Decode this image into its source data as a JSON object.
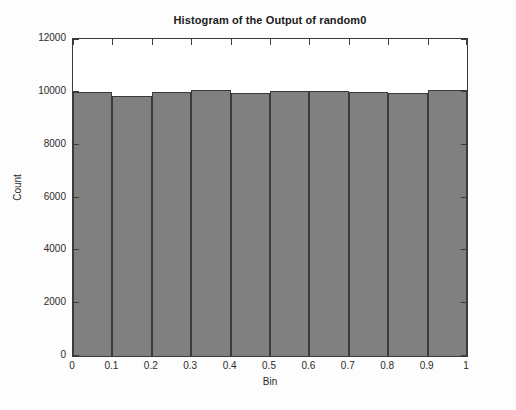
{
  "chart_data": {
    "type": "bar",
    "title": "Histogram of the Output of random0",
    "xlabel": "Bin",
    "ylabel": "Count",
    "categories": [
      "0-0.1",
      "0.1-0.2",
      "0.2-0.3",
      "0.3-0.4",
      "0.4-0.5",
      "0.5-0.6",
      "0.6-0.7",
      "0.7-0.8",
      "0.8-0.9",
      "0.9-1"
    ],
    "bin_edges": [
      0,
      0.1,
      0.2,
      0.3,
      0.4,
      0.5,
      0.6,
      0.7,
      0.8,
      0.9,
      1
    ],
    "values": [
      10000,
      9830,
      10010,
      10080,
      9940,
      10020,
      10030,
      9980,
      9950,
      10060
    ],
    "xlim": [
      0,
      1
    ],
    "ylim": [
      0,
      12000
    ],
    "xticks": [
      "0",
      "0.1",
      "0.2",
      "0.3",
      "0.4",
      "0.5",
      "0.6",
      "0.7",
      "0.8",
      "0.9",
      "1"
    ],
    "xtick_values": [
      0,
      0.1,
      0.2,
      0.3,
      0.4,
      0.5,
      0.6,
      0.7,
      0.8,
      0.9,
      1
    ],
    "yticks": [
      "0",
      "2000",
      "4000",
      "6000",
      "8000",
      "10000",
      "12000"
    ],
    "ytick_values": [
      0,
      2000,
      4000,
      6000,
      8000,
      10000,
      12000
    ],
    "grid": false,
    "legend": null,
    "bar_color": "#808080",
    "bar_edge_color": "#3a3a3a",
    "axes_color": "#3b3b3b",
    "background_color": "#ffffff",
    "tick_direction": "in"
  }
}
